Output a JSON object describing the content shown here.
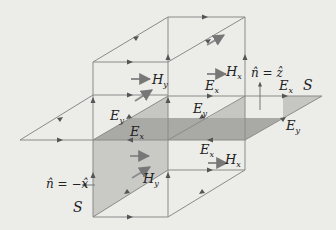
{
  "diagram": {
    "colors": {
      "background": "#ecece9",
      "line": "#888888",
      "arrow": "#555555",
      "plane_dark": "#a9a9a6",
      "plane_light": "#c8c8c5",
      "text": "#222222"
    },
    "labels": {
      "hy_top": {
        "main": "H",
        "sub": "y"
      },
      "hx_top": {
        "main": "H",
        "sub": "x"
      },
      "n_z": "n̂ = ẑ",
      "ex_top_mid": {
        "main": "E",
        "sub": "x"
      },
      "ex_top_right": {
        "main": "E",
        "sub": "x"
      },
      "s_right": "S",
      "ey_left": {
        "main": "E",
        "sub": "y"
      },
      "ey_mid": {
        "main": "E",
        "sub": "y"
      },
      "ex_plane": {
        "main": "E",
        "sub": "x"
      },
      "ey_right": {
        "main": "E",
        "sub": "y"
      },
      "ex_lower": {
        "main": "E",
        "sub": "x"
      },
      "hx_lower": {
        "main": "H",
        "sub": "x"
      },
      "n_minus_x": "n̂ = −x̂",
      "hy_lower": {
        "main": "H",
        "sub": "y"
      },
      "s_left": "S"
    }
  }
}
